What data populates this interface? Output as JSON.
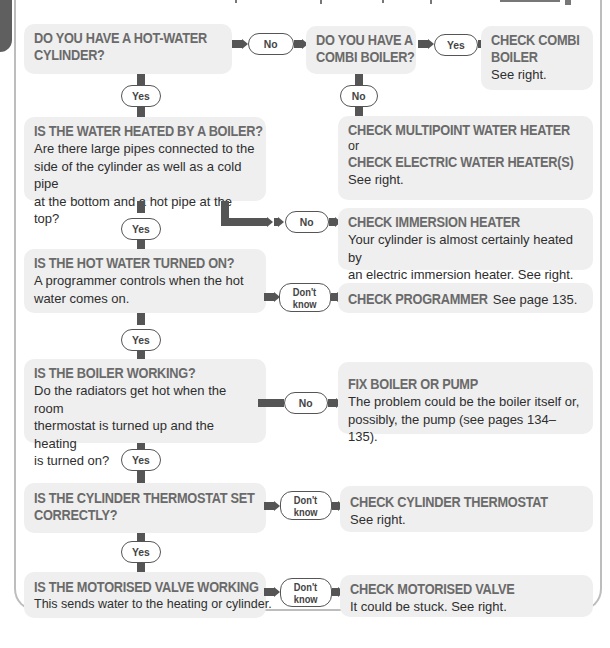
{
  "colors": {
    "box_bg": "#efefef",
    "heading": "#6a6a6a",
    "body_text": "#2e2e2e",
    "connector": "#555555",
    "frame": "#bdbdbd",
    "side_tab": "#5f5f5f"
  },
  "nodes": {
    "q1": {
      "title": "DO YOU HAVE A HOT-WATER CYLINDER?",
      "title_l1": "DO YOU HAVE A HOT-WATER",
      "title_l2": "CYLINDER?"
    },
    "q_combi": {
      "title_l1": "DO YOU HAVE A",
      "title_l2": "COMBI BOILER?"
    },
    "r_combi": {
      "title_l1": "CHECK COMBI",
      "title_l2": "BOILER",
      "text": "See right."
    },
    "r_multipoint": {
      "title1": "CHECK MULTIPOINT WATER HEATER",
      "or": "or",
      "title2": "CHECK ELECTRIC WATER HEATER(S)",
      "text": "See right."
    },
    "q2": {
      "title": "IS THE WATER HEATED BY A BOILER?",
      "text_l1": "Are there large pipes connected to the",
      "text_l2": "side of the cylinder as well as a cold pipe",
      "text_l3": "at the bottom and a hot pipe at the top?"
    },
    "r_immersion": {
      "title": "CHECK IMMERSION HEATER",
      "text_l1": "Your cylinder is almost certainly heated by",
      "text_l2": "an electric immersion heater. See right."
    },
    "q3": {
      "title": "IS THE HOT WATER TURNED ON?",
      "text_l1": "A programmer controls when the hot",
      "text_l2": "water comes on."
    },
    "r_programmer": {
      "title": "CHECK PROGRAMMER",
      "text": "See page 135."
    },
    "q4": {
      "title": "IS THE BOILER WORKING?",
      "text_l1": "Do the radiators get hot when the room",
      "text_l2": "thermostat is turned up and the heating",
      "text_l3": "is turned on?"
    },
    "r_boiler": {
      "title": "FIX BOILER OR PUMP",
      "text_l1": "The problem could be the boiler itself or,",
      "text_l2": "possibly, the pump (see pages 134–135)."
    },
    "q5": {
      "title_l1": "IS THE CYLINDER THERMOSTAT SET",
      "title_l2": "CORRECTLY?"
    },
    "r_thermostat": {
      "title": "CHECK CYLINDER THERMOSTAT",
      "text": "See right."
    },
    "q6": {
      "title": "IS THE MOTORISED VALVE WORKING",
      "text": "This sends water to the heating or cylinder."
    },
    "r_valve": {
      "title": "CHECK MOTORISED VALVE",
      "text": "It could be stuck. See right."
    }
  },
  "labels": {
    "yes": "Yes",
    "no": "No",
    "dont": "Don't",
    "know": "know"
  }
}
